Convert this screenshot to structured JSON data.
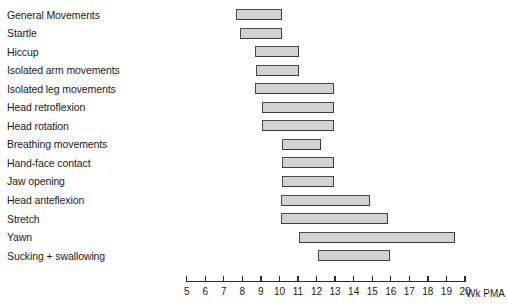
{
  "chart_data": {
    "type": "bar",
    "orientation": "horizontal",
    "title": "",
    "subtitle": "",
    "xlabel": "Wk PMA",
    "ylabel": "",
    "xlim": [
      5,
      20
    ],
    "grid": false,
    "legend": null,
    "value_unit": "weeks postmenstrual age",
    "bar_style": {
      "fill": "#d2d2d2",
      "border": "#4a4a4a"
    },
    "axis": {
      "title": "Wk PMA",
      "ticks": [
        5,
        6,
        7,
        8,
        9,
        10,
        11,
        12,
        13,
        14,
        15,
        16,
        17,
        18,
        19,
        20
      ],
      "tick_labels": [
        "5",
        "6",
        "7",
        "8",
        "9",
        "10",
        "11",
        "12",
        "13",
        "14",
        "15",
        "16",
        "17",
        "18",
        "19",
        "20"
      ]
    },
    "categories": [
      "General Movements",
      "Startle",
      "Hiccup",
      "Isolated arm movements",
      "Isolated leg movements",
      "Head retroflexion",
      "Head rotation",
      "Breathing movements",
      "Hand-face contact",
      "Jaw opening",
      "Head anteflexion",
      "Stretch",
      "Yawn",
      "Sucking + swallowing"
    ],
    "ranges": [
      {
        "label": "General Movements",
        "start": 7.7,
        "end": 10.2
      },
      {
        "label": "Startle",
        "start": 7.9,
        "end": 10.2
      },
      {
        "label": "Hiccup",
        "start": 8.7,
        "end": 11.1
      },
      {
        "label": "Isolated arm movements",
        "start": 8.8,
        "end": 11.1
      },
      {
        "label": "Isolated leg movements",
        "start": 8.7,
        "end": 13.0
      },
      {
        "label": "Head retroflexion",
        "start": 9.1,
        "end": 13.0
      },
      {
        "label": "Head rotation",
        "start": 9.1,
        "end": 13.0
      },
      {
        "label": "Breathing movements",
        "start": 10.2,
        "end": 12.3
      },
      {
        "label": "Hand-face contact",
        "start": 10.2,
        "end": 13.0
      },
      {
        "label": "Jaw opening",
        "start": 10.2,
        "end": 13.0
      },
      {
        "label": "Head anteflexion",
        "start": 10.1,
        "end": 14.9
      },
      {
        "label": "Stretch",
        "start": 10.1,
        "end": 15.9
      },
      {
        "label": "Yawn",
        "start": 11.1,
        "end": 19.5
      },
      {
        "label": "Sucking + swallowing",
        "start": 12.1,
        "end": 16.0
      }
    ]
  },
  "layout": {
    "row_height": 18.55,
    "first_row_center": 14.5,
    "axis_x_origin_px": 186,
    "px_per_week": 18.55,
    "axis_y_px": 281,
    "bar_height_px": 11,
    "axis_title_x_px": 466,
    "axis_title_y_px": 288
  }
}
